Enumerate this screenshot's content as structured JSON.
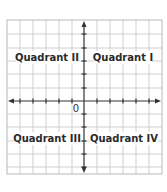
{
  "diagram": {
    "type": "coordinate-plane",
    "origin_label": "0",
    "quadrants": [
      {
        "id": "II",
        "label": "Quadrant II",
        "position": "top-left"
      },
      {
        "id": "I",
        "label": "Quadrant I",
        "position": "top-right"
      },
      {
        "id": "III",
        "label": "Quadrant III",
        "position": "bottom-left"
      },
      {
        "id": "IV",
        "label": "Quadrant IV",
        "position": "bottom-right"
      }
    ],
    "colors": {
      "grid": "#c8c8c8",
      "border": "#b8b8b8",
      "axis": "#333333",
      "text": "#2a2a2a",
      "background": "#ffffff"
    }
  }
}
